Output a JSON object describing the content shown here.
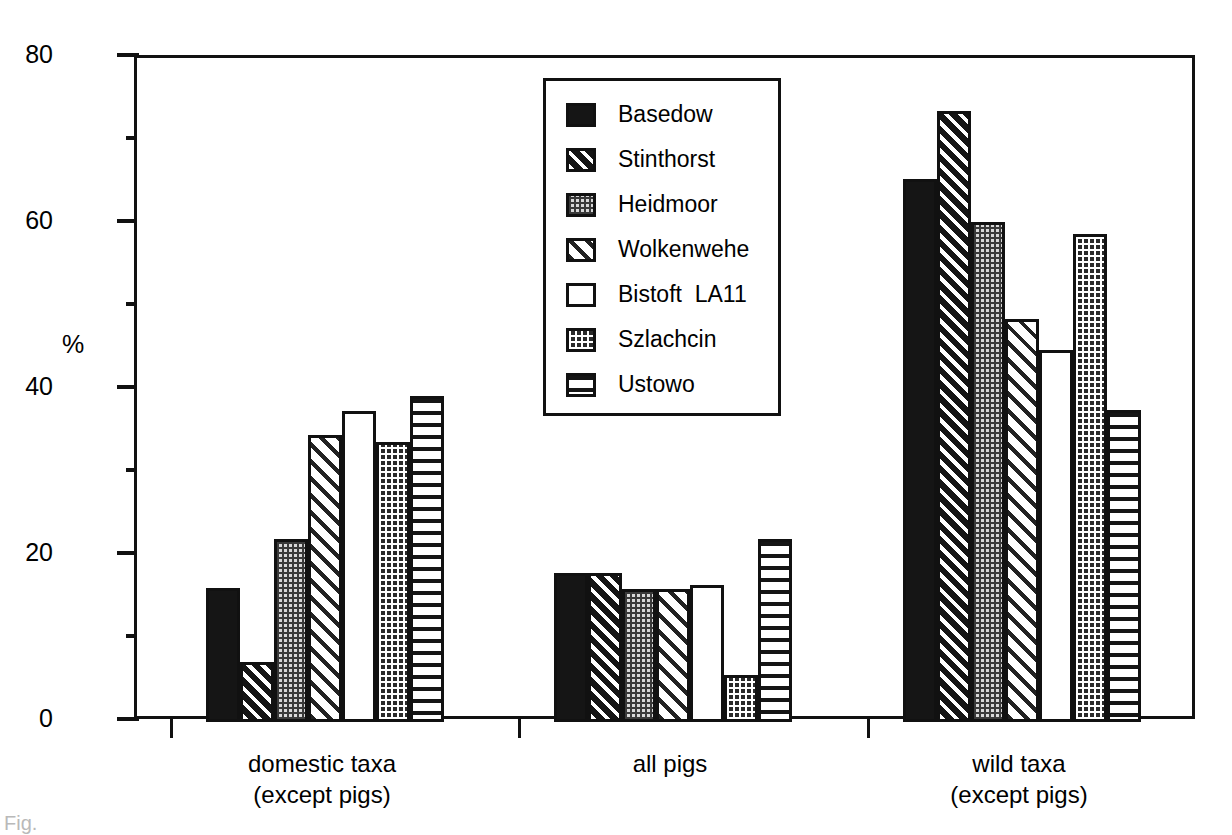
{
  "chart_data": {
    "type": "bar",
    "title": "",
    "xlabel": "",
    "ylabel": "%",
    "ylim": [
      0,
      80
    ],
    "ytick_labels": [
      "0",
      "20",
      "40",
      "60",
      "80"
    ],
    "ytick_values": [
      0,
      20,
      40,
      60,
      80
    ],
    "yminor_values": [
      10,
      30,
      50,
      70
    ],
    "grid": false,
    "legend_position": "inside-top-center",
    "categories": [
      {
        "line1": "domestic taxa",
        "line2": "(except pigs)"
      },
      {
        "line1": "all pigs",
        "line2": ""
      },
      {
        "line1": "wild taxa",
        "line2": "(except pigs)"
      }
    ],
    "series": [
      {
        "name": "Basedow",
        "pattern": "solid",
        "values": [
          16.2,
          17.9,
          65.4
        ]
      },
      {
        "name": "Stinthorst",
        "pattern": "hatch-dark",
        "values": [
          7.2,
          17.9,
          73.6
        ]
      },
      {
        "name": "Heidmoor",
        "pattern": "dots-light",
        "values": [
          22.0,
          16.0,
          60.2
        ]
      },
      {
        "name": "Wolkenwehe",
        "pattern": "hatch-light",
        "values": [
          34.6,
          16.0,
          48.6
        ]
      },
      {
        "name": "Bistoft  LA11",
        "pattern": "empty",
        "values": [
          37.5,
          16.5,
          44.8
        ]
      },
      {
        "name": "Szlachcin",
        "pattern": "dots-dark",
        "values": [
          33.7,
          5.7,
          58.8
        ]
      },
      {
        "name": "Ustowo",
        "pattern": "hlines",
        "values": [
          39.3,
          22.1,
          37.6
        ]
      }
    ]
  },
  "figure": {
    "caption_fragment": "Fig."
  }
}
